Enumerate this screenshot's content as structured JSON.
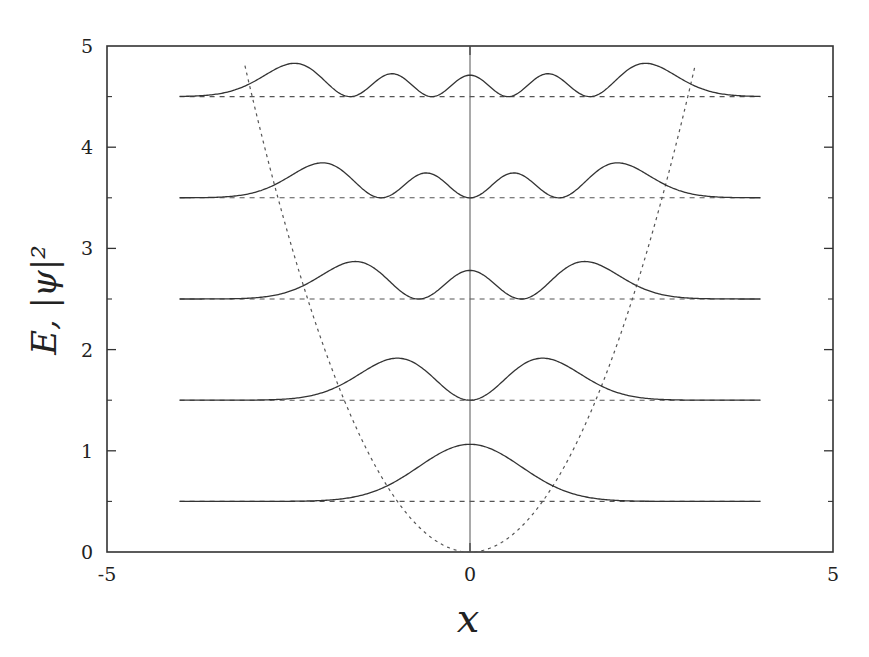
{
  "chart_data": {
    "type": "line",
    "title": "",
    "xlabel": "x",
    "ylabel": "E, |ψ|²",
    "xlim": [
      -5,
      5
    ],
    "ylim": [
      0,
      5
    ],
    "grid": false,
    "legend": null,
    "x_ticks": [
      "-5",
      "0",
      "5"
    ],
    "y_ticks": [
      "0",
      "1",
      "2",
      "3",
      "4",
      "5"
    ],
    "y_minor_ticks": [
      0.5,
      1.5,
      2.5,
      3.5,
      4.5
    ],
    "potential": {
      "name": "V(x) = x²/2",
      "style": "dotted",
      "x_range": [
        -3.1,
        3.1
      ]
    },
    "series": [
      {
        "name": "n=0",
        "energy": 0.5,
        "peak_density": 0.56,
        "x_range": [
          -4,
          4
        ],
        "style": "solid"
      },
      {
        "name": "n=1",
        "energy": 1.5,
        "peak_density": 0.41,
        "x_range": [
          -4,
          4
        ],
        "style": "solid"
      },
      {
        "name": "n=2",
        "energy": 2.5,
        "peak_density": 0.36,
        "x_range": [
          -4,
          4
        ],
        "style": "solid"
      },
      {
        "name": "n=3",
        "energy": 3.5,
        "peak_density": 0.34,
        "x_range": [
          -4,
          4
        ],
        "style": "solid"
      },
      {
        "name": "n=4",
        "energy": 4.5,
        "peak_density": 0.32,
        "x_range": [
          -4,
          4
        ],
        "style": "solid"
      }
    ],
    "energy_lines": {
      "style": "dashed",
      "values": [
        0.5,
        1.5,
        2.5,
        3.5,
        4.5
      ],
      "x_range": [
        -4,
        4
      ]
    },
    "center_line": {
      "x": 0,
      "style": "solid thin"
    }
  }
}
